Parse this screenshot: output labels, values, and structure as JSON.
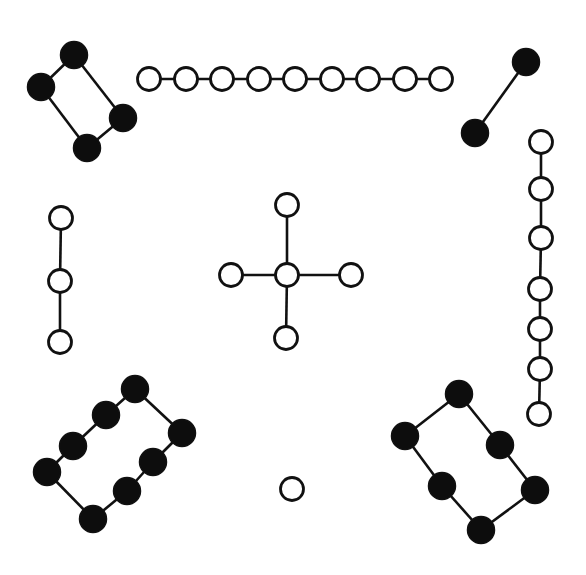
{
  "diagram": {
    "type": "graph",
    "colors": {
      "filled": "#0d0d0d",
      "open": "#ffffff",
      "stroke": "#111111"
    },
    "components": [
      {
        "name": "top-left-cycle",
        "node_style": "filled",
        "shape": "cycle",
        "node_count": 4,
        "nodes": [
          [
            74,
            55
          ],
          [
            41,
            87
          ],
          [
            87,
            148
          ],
          [
            123,
            118
          ]
        ],
        "edges": [
          [
            0,
            1
          ],
          [
            1,
            2
          ],
          [
            2,
            3
          ],
          [
            3,
            0
          ]
        ]
      },
      {
        "name": "top-path",
        "node_style": "open",
        "shape": "path",
        "node_count": 9,
        "nodes": [
          [
            149,
            79
          ],
          [
            186,
            79
          ],
          [
            222,
            79
          ],
          [
            259,
            79
          ],
          [
            295,
            79
          ],
          [
            332,
            79
          ],
          [
            368,
            79
          ],
          [
            405,
            79
          ],
          [
            441,
            79
          ]
        ],
        "edges": [
          [
            0,
            1
          ],
          [
            1,
            2
          ],
          [
            2,
            3
          ],
          [
            3,
            4
          ],
          [
            4,
            5
          ],
          [
            5,
            6
          ],
          [
            6,
            7
          ],
          [
            7,
            8
          ]
        ]
      },
      {
        "name": "top-right-edge",
        "node_style": "filled",
        "shape": "path",
        "node_count": 2,
        "nodes": [
          [
            526,
            62
          ],
          [
            475,
            133
          ]
        ],
        "edges": [
          [
            0,
            1
          ]
        ]
      },
      {
        "name": "right-path",
        "node_style": "open",
        "shape": "path",
        "node_count": 7,
        "nodes": [
          [
            541,
            142
          ],
          [
            541,
            189
          ],
          [
            541,
            238
          ],
          [
            540,
            289
          ],
          [
            540,
            329
          ],
          [
            540,
            369
          ],
          [
            539,
            414
          ]
        ],
        "edges": [
          [
            0,
            1
          ],
          [
            1,
            2
          ],
          [
            2,
            3
          ],
          [
            3,
            4
          ],
          [
            4,
            5
          ],
          [
            5,
            6
          ]
        ]
      },
      {
        "name": "left-path",
        "node_style": "open",
        "shape": "path",
        "node_count": 3,
        "nodes": [
          [
            61,
            218
          ],
          [
            60,
            281
          ],
          [
            60,
            342
          ]
        ],
        "edges": [
          [
            0,
            1
          ],
          [
            1,
            2
          ]
        ]
      },
      {
        "name": "center-star",
        "node_style": "open",
        "shape": "star",
        "node_count": 5,
        "nodes": [
          [
            287,
            275
          ],
          [
            287,
            205
          ],
          [
            286,
            338
          ],
          [
            231,
            275
          ],
          [
            351,
            275
          ]
        ],
        "edges": [
          [
            0,
            1
          ],
          [
            0,
            2
          ],
          [
            0,
            3
          ],
          [
            0,
            4
          ]
        ]
      },
      {
        "name": "bottom-left-cycle",
        "node_style": "filled",
        "shape": "cycle",
        "node_count": 8,
        "nodes": [
          [
            135,
            389
          ],
          [
            106,
            415
          ],
          [
            73,
            446
          ],
          [
            47,
            472
          ],
          [
            93,
            519
          ],
          [
            127,
            491
          ],
          [
            153,
            462
          ],
          [
            182,
            433
          ]
        ],
        "edges": [
          [
            0,
            1
          ],
          [
            1,
            2
          ],
          [
            2,
            3
          ],
          [
            3,
            4
          ],
          [
            4,
            5
          ],
          [
            5,
            6
          ],
          [
            6,
            7
          ],
          [
            7,
            0
          ]
        ]
      },
      {
        "name": "bottom-right-cycle",
        "node_style": "filled",
        "shape": "cycle",
        "node_count": 6,
        "nodes": [
          [
            459,
            394
          ],
          [
            405,
            436
          ],
          [
            442,
            486
          ],
          [
            481,
            530
          ],
          [
            535,
            490
          ],
          [
            500,
            445
          ]
        ],
        "edges": [
          [
            0,
            1
          ],
          [
            1,
            2
          ],
          [
            2,
            3
          ],
          [
            3,
            4
          ],
          [
            4,
            5
          ],
          [
            5,
            0
          ]
        ]
      },
      {
        "name": "isolated-node",
        "node_style": "open",
        "shape": "single",
        "node_count": 1,
        "nodes": [
          [
            292,
            489
          ]
        ],
        "edges": []
      }
    ]
  }
}
